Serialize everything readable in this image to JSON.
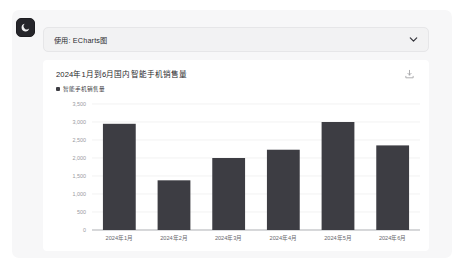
{
  "window": {
    "background": "#ffffff",
    "panel_background": "#f7f7f8"
  },
  "theme_toggle": {
    "icon": "moon-icon",
    "name": "dark-mode-toggle",
    "background": "#26262b"
  },
  "select": {
    "label": "使用: ECharts图",
    "chevron_icon": "chevron-down-icon",
    "background": "#f2f2f3"
  },
  "chart_card": {
    "toolbox_icon": "download-save-icon"
  },
  "chart_data": {
    "type": "bar",
    "title": "2024年1月到6月国内智能手机销售量",
    "xlabel": "",
    "ylabel": "",
    "categories": [
      "2024年1月",
      "2024年2月",
      "2024年3月",
      "2024年4月",
      "2024年5月",
      "2024年6月"
    ],
    "series": [
      {
        "name": "智能手机销售量",
        "values": [
          2950,
          1380,
          2000,
          2230,
          3000,
          2350
        ],
        "color": "#3d3d43"
      }
    ],
    "legend": [
      "智能手机销售量"
    ],
    "legend_position": "top-left",
    "ylim": [
      0,
      3500
    ],
    "yticks": [
      0,
      500,
      1000,
      1500,
      2000,
      2500,
      3000,
      3500
    ],
    "ytick_labels": [
      "0",
      "500",
      "1,000",
      "1,500",
      "2,000",
      "2,500",
      "3,000",
      "3,500"
    ],
    "grid": true,
    "grid_color": "#ececed",
    "axis_color": "#999ba0"
  }
}
